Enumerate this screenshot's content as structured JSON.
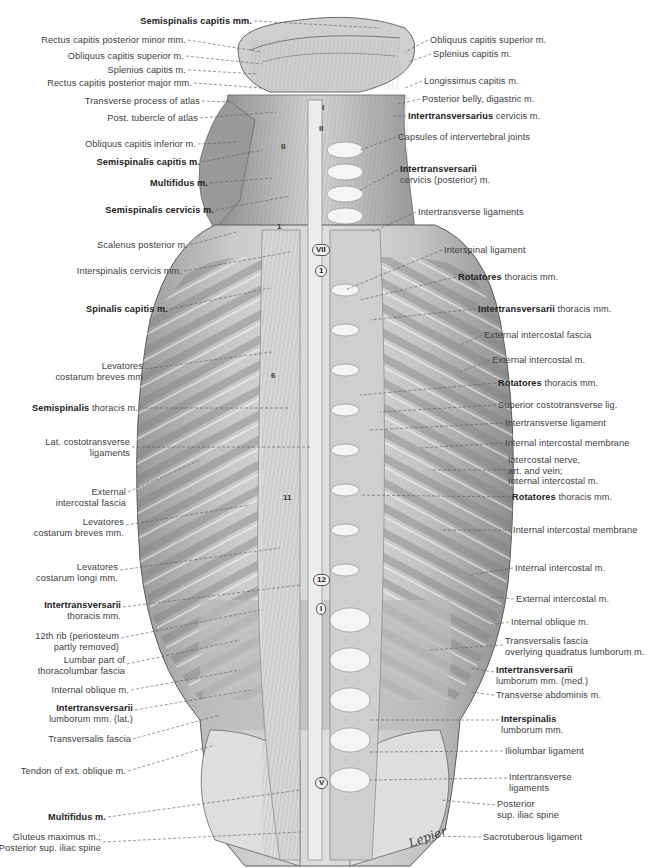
{
  "figure": {
    "view": "Deep back muscles and ligaments, posterior view",
    "colors": {
      "background": "#ffffff",
      "ink": "#3d3d3d",
      "tissue_light": "#e6e6e6",
      "tissue_mid": "#bdbdbd",
      "tissue_dark": "#8a8a8a"
    }
  },
  "labels_left": [
    {
      "bold": "Semispinalis capitis mm.",
      "rest": "",
      "x": 90,
      "y": 16,
      "w": 162
    },
    {
      "bold": "",
      "rest": "Rectus capitis posterior minor mm.",
      "x": 20,
      "y": 35,
      "w": 166
    },
    {
      "bold": "",
      "rest": "Obliquus capitis superior m.",
      "x": 40,
      "y": 51,
      "w": 144
    },
    {
      "bold": "",
      "rest": "Splenius capitis m.",
      "x": 80,
      "y": 65,
      "w": 106
    },
    {
      "bold": "",
      "rest": "Rectus capitis posterior major mm.",
      "x": 20,
      "y": 78,
      "w": 172
    },
    {
      "bold": "",
      "rest": "Transverse process of atlas",
      "x": 60,
      "y": 96,
      "w": 140
    },
    {
      "bold": "",
      "rest": "Post. tubercle of atlas",
      "x": 80,
      "y": 113,
      "w": 118
    },
    {
      "bold": "",
      "rest": "Obliquus capitis inferior m.",
      "x": 60,
      "y": 139,
      "w": 136
    },
    {
      "bold": "Semispinalis capitis m.",
      "rest": "",
      "x": 80,
      "y": 157,
      "w": 120
    },
    {
      "bold": "Multifidus m.",
      "rest": "",
      "x": 120,
      "y": 178,
      "w": 88
    },
    {
      "bold": "Semispinalis cervicis m.",
      "rest": "",
      "x": 80,
      "y": 205,
      "w": 134
    },
    {
      "bold": "",
      "rest": "Scalenus posterior m.",
      "x": 80,
      "y": 240,
      "w": 108
    },
    {
      "bold": "",
      "rest": "Interspinalis cervicis mm.",
      "x": 60,
      "y": 266,
      "w": 122
    },
    {
      "bold": "Spinalis capitis m.",
      "rest": "",
      "x": 70,
      "y": 304,
      "w": 98
    },
    {
      "bold": "",
      "rest": "Levatores\ncostarum breves mm",
      "x": 40,
      "y": 361,
      "w": 103
    },
    {
      "bold": "Semispinalis",
      "rest": " thoracis m.",
      "x": 30,
      "y": 403,
      "w": 108
    },
    {
      "bold": "",
      "rest": "Lat. costotransverse\nligaments",
      "x": 30,
      "y": 437,
      "w": 100
    },
    {
      "bold": "",
      "rest": "External\nintercostal fascia",
      "x": 40,
      "y": 487,
      "w": 86
    },
    {
      "bold": "",
      "rest": "Levatores\ncostarum breves mm.",
      "x": 30,
      "y": 517,
      "w": 94
    },
    {
      "bold": "",
      "rest": "Levatores\ncostarum longi mm.",
      "x": 30,
      "y": 562,
      "w": 88
    },
    {
      "bold": "Intertransversarii",
      "rest": "\nthoracis mm.",
      "x": 40,
      "y": 600,
      "w": 81
    },
    {
      "bold": "",
      "rest": "12th rib (periosteum\npartly removed)",
      "x": 30,
      "y": 631,
      "w": 89
    },
    {
      "bold": "",
      "rest": "Lumbar part of\nthoracolumbar fascia",
      "x": 30,
      "y": 655,
      "w": 95
    },
    {
      "bold": "",
      "rest": "Internal oblique m.",
      "x": 40,
      "y": 685,
      "w": 89
    },
    {
      "bold": "Intertransversarii",
      "rest": "\nlumborum mm. (lat.)",
      "x": 40,
      "y": 703,
      "w": 93
    },
    {
      "bold": "",
      "rest": "Transversalis fascia",
      "x": 40,
      "y": 734,
      "w": 91
    },
    {
      "bold": "",
      "rest": "Tendon of ext. oblique m.",
      "x": 20,
      "y": 766,
      "w": 106
    },
    {
      "bold": "Multifidus m.",
      "rest": "",
      "x": 40,
      "y": 812,
      "w": 66
    },
    {
      "bold": "",
      "rest": "Gluteus maximus m.;\nPosterior sup. iliac spine",
      "x": 0,
      "y": 832,
      "w": 101
    }
  ],
  "labels_right": [
    {
      "bold": "",
      "rest": "Obliquus capitis superior m.",
      "x": 430,
      "y": 35
    },
    {
      "bold": "",
      "rest": "Splenius capitis m.",
      "x": 433,
      "y": 49
    },
    {
      "bold": "",
      "rest": "Longissimus capitis m.",
      "x": 424,
      "y": 76
    },
    {
      "bold": "",
      "rest": "Posterior belly, digastric m.",
      "x": 422,
      "y": 94
    },
    {
      "bold": "Intertransversarius",
      "rest": " cervicis m.",
      "x": 408,
      "y": 111
    },
    {
      "bold": "",
      "rest": "Capsules of intervertebral joints",
      "x": 398,
      "y": 132
    },
    {
      "bold": "Intertransversarii",
      "rest": "\ncervicis (posterior) m.",
      "x": 400,
      "y": 164
    },
    {
      "bold": "",
      "rest": "Intertransverse ligaments",
      "x": 418,
      "y": 207
    },
    {
      "bold": "",
      "rest": "Interspinal ligament",
      "x": 444,
      "y": 245
    },
    {
      "bold": "Rotatores",
      "rest": " thoracis mm.",
      "x": 458,
      "y": 272
    },
    {
      "bold": "Intertransversarii",
      "rest": " thoracis mm.",
      "x": 478,
      "y": 304
    },
    {
      "bold": "",
      "rest": "External intercostal fascia",
      "x": 484,
      "y": 330
    },
    {
      "bold": "",
      "rest": "External intercostal m.",
      "x": 492,
      "y": 355
    },
    {
      "bold": "Rotatores",
      "rest": " thoracis mm.",
      "x": 498,
      "y": 378
    },
    {
      "bold": "",
      "rest": "Superior costotransverse lig.",
      "x": 498,
      "y": 400
    },
    {
      "bold": "",
      "rest": "Intertransverse ligament",
      "x": 505,
      "y": 418
    },
    {
      "bold": "",
      "rest": "Internal intercostal membrane",
      "x": 505,
      "y": 438
    },
    {
      "bold": "",
      "rest": "Intercostal nerve,\nart. and vein;\nInternal intercostal m.",
      "x": 508,
      "y": 455
    },
    {
      "bold": "Rotatores",
      "rest": " thoracis mm.",
      "x": 512,
      "y": 492
    },
    {
      "bold": "",
      "rest": "Internal intercostal membrane",
      "x": 513,
      "y": 525
    },
    {
      "bold": "",
      "rest": "Internal intercostal m.",
      "x": 515,
      "y": 563
    },
    {
      "bold": "",
      "rest": "External intercostal m.",
      "x": 516,
      "y": 594
    },
    {
      "bold": "",
      "rest": "Internal oblique m.",
      "x": 511,
      "y": 617
    },
    {
      "bold": "",
      "rest": "Transversalis fascia\noverlying quadratus lumborum m.",
      "x": 505,
      "y": 636
    },
    {
      "bold": "Intertransversarii",
      "rest": "\nlumborum mm. (med.)",
      "x": 496,
      "y": 665
    },
    {
      "bold": "",
      "rest": "Transverse abdominis m.",
      "x": 496,
      "y": 690
    },
    {
      "bold": "Interspinalis",
      "rest": "\nlumborum mm.",
      "x": 501,
      "y": 714
    },
    {
      "bold": "",
      "rest": "Iliolumbar ligament",
      "x": 505,
      "y": 746
    },
    {
      "bold": "",
      "rest": "Intertransverse\nligaments",
      "x": 509,
      "y": 772
    },
    {
      "bold": "",
      "rest": "Posterior\nsup. iliac spine",
      "x": 497,
      "y": 799
    },
    {
      "bold": "",
      "rest": "Sacrotuberous ligament",
      "x": 483,
      "y": 832
    }
  ],
  "vertebra_markers": [
    {
      "text": "I",
      "x": 319,
      "y": 103,
      "boxed": false
    },
    {
      "text": "II",
      "x": 316,
      "y": 124,
      "boxed": false
    },
    {
      "text": "II",
      "x": 278,
      "y": 142,
      "boxed": false
    },
    {
      "text": "VII",
      "x": 312,
      "y": 244,
      "boxed": true
    },
    {
      "text": "1",
      "x": 315,
      "y": 265,
      "boxed": true
    },
    {
      "text": "1",
      "x": 274,
      "y": 222,
      "boxed": false
    },
    {
      "text": "6",
      "x": 268,
      "y": 371,
      "boxed": false
    },
    {
      "text": "11",
      "x": 280,
      "y": 493,
      "boxed": false
    },
    {
      "text": "12",
      "x": 313,
      "y": 574,
      "boxed": true
    },
    {
      "text": "I",
      "x": 316,
      "y": 603,
      "boxed": true
    },
    {
      "text": "V",
      "x": 315,
      "y": 777,
      "boxed": true
    }
  ],
  "signature": "Lepier"
}
